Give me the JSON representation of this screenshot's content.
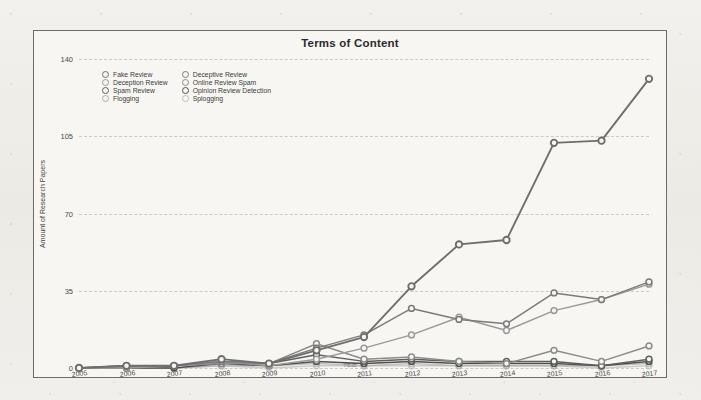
{
  "chart_data": {
    "type": "line",
    "title": "Terms of Content",
    "xlabel": "Year",
    "ylabel": "Amount of Research Papers",
    "grid": true,
    "legend_position": "top-left-inside",
    "categories": [
      "2005",
      "2006",
      "2007",
      "2008",
      "2009",
      "2010",
      "2011",
      "2012",
      "2013",
      "2014",
      "2015",
      "2016",
      "2017"
    ],
    "x": [
      2005,
      2006,
      2007,
      2008,
      2009,
      2010,
      2011,
      2012,
      2013,
      2014,
      2015,
      2016,
      2017
    ],
    "ylim": [
      0,
      140
    ],
    "yticks": [
      0,
      35,
      70,
      105,
      140
    ],
    "xlim": [
      2005,
      2017
    ],
    "series": [
      {
        "name": "Fake Review",
        "color": "#6e6e6e",
        "values": [
          0,
          1,
          1,
          4,
          2,
          8,
          14,
          37,
          56,
          58,
          102,
          103,
          131
        ]
      },
      {
        "name": "Deceptive Review",
        "color": "#7b7b7b",
        "values": [
          0,
          1,
          1,
          3,
          2,
          9,
          15,
          27,
          22,
          20,
          34,
          31,
          39
        ]
      },
      {
        "name": "Deception Review",
        "color": "#9a9a9a",
        "values": [
          0,
          0,
          1,
          3,
          1,
          4,
          9,
          15,
          23,
          17,
          26,
          31,
          38
        ]
      },
      {
        "name": "Online Review Spam",
        "color": "#8c8c8c",
        "values": [
          0,
          0,
          1,
          2,
          2,
          11,
          4,
          5,
          3,
          2,
          8,
          3,
          10
        ]
      },
      {
        "name": "Spam Review",
        "color": "#5f5f5f",
        "values": [
          0,
          1,
          1,
          3,
          2,
          6,
          3,
          4,
          3,
          3,
          3,
          1,
          4
        ]
      },
      {
        "name": "Opinion Review Detection",
        "color": "#4f4f4f",
        "values": [
          0,
          0,
          0,
          2,
          1,
          3,
          2,
          3,
          2,
          2,
          2,
          1,
          3
        ]
      },
      {
        "name": "Flogging",
        "color": "#aeaeae",
        "values": [
          0,
          0,
          0,
          1,
          1,
          2,
          1,
          2,
          1,
          1,
          1,
          1,
          2
        ]
      },
      {
        "name": "Splogging",
        "color": "#bdbdbd",
        "values": [
          0,
          0,
          0,
          1,
          0,
          1,
          1,
          1,
          1,
          1,
          1,
          0,
          1
        ]
      }
    ]
  },
  "legend": {
    "items": [
      {
        "label": "Fake Review"
      },
      {
        "label": "Deceptive Review"
      },
      {
        "label": "Deception Review"
      },
      {
        "label": "Online Review Spam"
      },
      {
        "label": "Spam Review"
      },
      {
        "label": "Opinion Review Detection"
      },
      {
        "label": "Flogging"
      },
      {
        "label": "Splogging"
      }
    ]
  }
}
